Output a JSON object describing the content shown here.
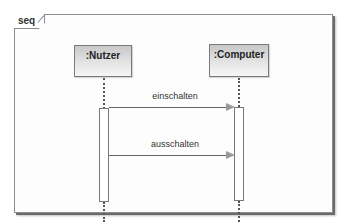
{
  "diagram": {
    "type": "sequence",
    "frame_label": "seq",
    "lifelines": [
      {
        "name": ":Nutzer"
      },
      {
        "name": ":Computer"
      }
    ],
    "messages": [
      {
        "label": "einschalten",
        "from": ":Nutzer",
        "to": ":Computer"
      },
      {
        "label": "ausschalten",
        "from": ":Nutzer",
        "to": ":Computer"
      }
    ]
  }
}
